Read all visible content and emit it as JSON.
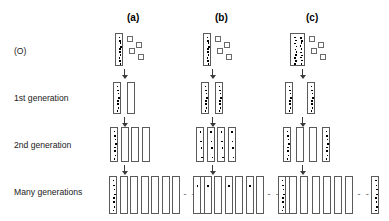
{
  "figure": {
    "background_color": "#ffffff",
    "cell_outline_color": "#5a5a5a",
    "dot_color": "#000000",
    "arrow_color": "#3a3a3a",
    "ellipsis_text": "- - -"
  },
  "columns": [
    {
      "key": "a",
      "label": "(a)",
      "x": 143
    },
    {
      "key": "b",
      "label": "(b)",
      "x": 231
    },
    {
      "key": "c",
      "label": "(c)",
      "x": 322
    }
  ],
  "rows": [
    {
      "key": "origin",
      "label": "(O)",
      "y": 52
    },
    {
      "key": "gen1",
      "label": "1st generation",
      "y": 98
    },
    {
      "key": "gen2",
      "label": "2nd generation",
      "y": 145
    },
    {
      "key": "many",
      "label": "Many generations",
      "y": 192
    }
  ],
  "chart_data": {
    "type": "diagram",
    "columns": [
      "(a)",
      "(b)",
      "(c)"
    ],
    "rows": [
      "(O)",
      "1st generation",
      "2nd generation",
      "Many generations"
    ],
    "models": {
      "a": {
        "origin": {
          "labeled_cells": 1,
          "cell_width": 8,
          "dot_columns": 1,
          "dot_count": 10,
          "free_squares": 4
        },
        "gen1": {
          "cells": [
            {
              "labeled": true,
              "dots": 8
            },
            {
              "labeled": false,
              "dots": 0
            }
          ]
        },
        "gen2": {
          "cells": [
            {
              "labeled": true,
              "dots": 8
            },
            {
              "labeled": false,
              "dots": 0
            },
            {
              "labeled": false,
              "dots": 0
            },
            {
              "labeled": false,
              "dots": 0
            }
          ]
        },
        "many": {
          "cells": [
            {
              "labeled": true,
              "dots": 8
            },
            {
              "labeled": false,
              "dots": 0
            },
            {
              "labeled": false,
              "dots": 0
            },
            {
              "labeled": false,
              "dots": 0
            },
            {
              "labeled": false,
              "dots": 0
            },
            {
              "labeled": false,
              "dots": 0
            },
            {
              "labeled": false,
              "dots": 0
            }
          ],
          "trailing_cells": [
            {
              "labeled": false,
              "dots": 0
            }
          ]
        }
      },
      "b": {
        "origin": {
          "labeled_cells": 1,
          "cell_width": 8,
          "dot_columns": 1,
          "dot_count": 10,
          "free_squares": 4
        },
        "gen1": {
          "cells": [
            {
              "labeled": true,
              "dots": 8
            },
            {
              "labeled": true,
              "dots": 8
            }
          ]
        },
        "gen2": {
          "cells": [
            {
              "labeled": true,
              "dots": 4
            },
            {
              "labeled": true,
              "dots": 4
            },
            {
              "labeled": true,
              "dots": 4
            },
            {
              "labeled": true,
              "dots": 4
            }
          ]
        },
        "many": {
          "cells": [
            {
              "labeled": true,
              "dots": 1
            },
            {
              "labeled": true,
              "dots": 1
            },
            {
              "labeled": false,
              "dots": 0
            },
            {
              "labeled": true,
              "dots": 1
            },
            {
              "labeled": false,
              "dots": 0
            },
            {
              "labeled": true,
              "dots": 1
            },
            {
              "labeled": false,
              "dots": 0
            }
          ],
          "trailing_cells": [
            {
              "labeled": false,
              "dots": 0
            }
          ]
        }
      },
      "c": {
        "origin": {
          "labeled_cells": 1,
          "cell_width": 15,
          "dot_columns": 2,
          "dot_count": 20,
          "free_squares": 4
        },
        "gen1": {
          "cells": [
            {
              "labeled": true,
              "dots": 8
            },
            {
              "labeled": true,
              "dots": 8
            }
          ]
        },
        "gen2": {
          "cells": [
            {
              "labeled": true,
              "dots": 8
            },
            {
              "labeled": false,
              "dots": 0
            },
            {
              "labeled": false,
              "dots": 0
            },
            {
              "labeled": true,
              "dots": 8
            }
          ]
        },
        "many": {
          "cells": [
            {
              "labeled": true,
              "dots": 8
            },
            {
              "labeled": false,
              "dots": 0
            },
            {
              "labeled": false,
              "dots": 0
            },
            {
              "labeled": false,
              "dots": 0
            },
            {
              "labeled": false,
              "dots": 0
            },
            {
              "labeled": false,
              "dots": 0
            },
            {
              "labeled": false,
              "dots": 0
            }
          ],
          "trailing_cells": [
            {
              "labeled": true,
              "dots": 8
            }
          ]
        }
      }
    }
  }
}
